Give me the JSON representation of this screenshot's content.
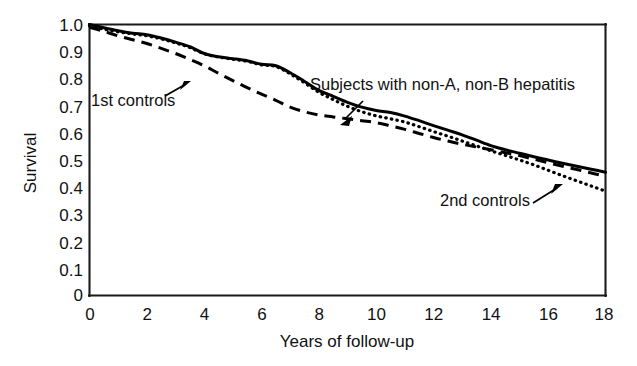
{
  "chart_data": {
    "type": "line",
    "title": "",
    "subtitle": "",
    "xlabel": "Years of follow-up",
    "ylabel": "Survival",
    "xlim": [
      0,
      18
    ],
    "ylim": [
      0,
      1.0
    ],
    "grid": false,
    "legend_position": "inline-annotations",
    "x_ticks": [
      0,
      2,
      4,
      6,
      8,
      10,
      12,
      14,
      16,
      18
    ],
    "x_tick_labels": [
      "0",
      "2",
      "4",
      "6",
      "8",
      "10",
      "12",
      "14",
      "16",
      "18"
    ],
    "y_ticks": [
      0,
      0.1,
      0.2,
      0.3,
      0.4,
      0.5,
      0.6,
      0.7,
      0.8,
      0.9,
      1.0
    ],
    "y_tick_labels": [
      "0",
      "0.1",
      "0.2",
      "0.3",
      "0.4",
      "0.5",
      "0.6",
      "0.7",
      "0.8",
      "0.9",
      "1.0"
    ],
    "x": [
      0,
      0.5,
      1,
      1.5,
      2,
      2.5,
      3,
      3.5,
      4,
      4.5,
      5,
      5.5,
      6,
      6.5,
      7,
      7.5,
      8,
      8.5,
      9,
      9.5,
      10,
      10.5,
      11,
      11.5,
      12,
      12.5,
      13,
      13.5,
      14,
      14.5,
      15,
      15.5,
      16,
      16.5,
      17,
      17.5,
      18
    ],
    "series": [
      {
        "name": "Subjects with non-A, non-B hepatitis",
        "style": "solid",
        "values": [
          1.0,
          0.988,
          0.977,
          0.968,
          0.962,
          0.95,
          0.935,
          0.918,
          0.893,
          0.881,
          0.874,
          0.866,
          0.853,
          0.848,
          0.822,
          0.79,
          0.757,
          0.735,
          0.713,
          0.695,
          0.683,
          0.675,
          0.662,
          0.645,
          0.627,
          0.61,
          0.593,
          0.573,
          0.553,
          0.538,
          0.525,
          0.512,
          0.5,
          0.488,
          0.477,
          0.466,
          0.455
        ]
      },
      {
        "name": "1st controls",
        "style": "dashed",
        "values": [
          0.99,
          0.975,
          0.958,
          0.944,
          0.93,
          0.912,
          0.893,
          0.871,
          0.848,
          0.82,
          0.793,
          0.767,
          0.743,
          0.72,
          0.695,
          0.678,
          0.666,
          0.659,
          0.652,
          0.645,
          0.638,
          0.626,
          0.613,
          0.598,
          0.583,
          0.57,
          0.558,
          0.548,
          0.538,
          0.527,
          0.516,
          0.503,
          0.49,
          0.477,
          0.465,
          0.452,
          0.44
        ]
      },
      {
        "name": "2nd controls",
        "style": "dotted",
        "values": [
          0.995,
          0.983,
          0.973,
          0.965,
          0.958,
          0.947,
          0.932,
          0.915,
          0.892,
          0.88,
          0.872,
          0.864,
          0.851,
          0.845,
          0.818,
          0.785,
          0.75,
          0.723,
          0.698,
          0.678,
          0.663,
          0.652,
          0.64,
          0.623,
          0.605,
          0.588,
          0.57,
          0.552,
          0.534,
          0.517,
          0.5,
          0.482,
          0.462,
          0.442,
          0.423,
          0.404,
          0.385
        ]
      }
    ],
    "annotations": [
      {
        "id": "subjects",
        "text": "Subjects with non-A, non-B hepatitis",
        "points_to_series": "Subjects with non-A, non-B hepatitis",
        "arrow_direction": "down-left"
      },
      {
        "id": "first-controls",
        "text": "1st controls",
        "points_to_series": "1st controls",
        "arrow_direction": "up-right"
      },
      {
        "id": "second-controls",
        "text": "2nd controls",
        "points_to_series": "2nd controls",
        "arrow_direction": "up-right"
      }
    ]
  },
  "colors": {
    "background": "#ffffff",
    "axis": "#1a1a1a",
    "curve": "#000000",
    "text": "#111111"
  }
}
